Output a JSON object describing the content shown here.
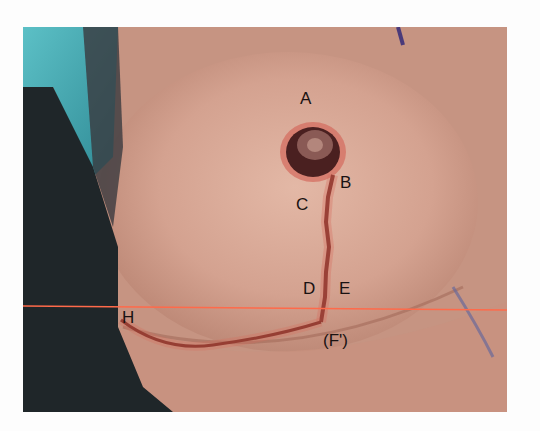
{
  "figure": {
    "labels": [
      {
        "id": "A",
        "text": "A",
        "x": 300,
        "y": 90
      },
      {
        "id": "B",
        "text": "B",
        "x": 340,
        "y": 174
      },
      {
        "id": "C",
        "text": "C",
        "x": 296,
        "y": 196
      },
      {
        "id": "D",
        "text": "D",
        "x": 303,
        "y": 280
      },
      {
        "id": "E",
        "text": "E",
        "x": 339,
        "y": 280
      },
      {
        "id": "F",
        "text": "(F')",
        "x": 323,
        "y": 332
      },
      {
        "id": "H",
        "text": "H",
        "x": 122,
        "y": 309
      }
    ],
    "colors": {
      "skin": "#c79886",
      "skin_light": "#d8aa98",
      "drape_teal": "#4aa7b0",
      "drape_dark": "#1e2528",
      "incision": "#7a2a22",
      "guide_line": "#ff6a4a"
    }
  }
}
